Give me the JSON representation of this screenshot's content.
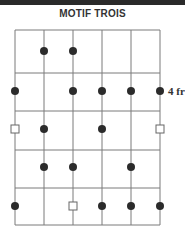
{
  "title": "MOTIF TROIS",
  "fret_label": "4 fr",
  "grid": {
    "strings_x": [
      15,
      44,
      73,
      102,
      131,
      160
    ],
    "frets_y": [
      30,
      73,
      111,
      150,
      188,
      225
    ],
    "line_color": "#7a7a7a",
    "dot_color": "#2b2b2b"
  },
  "rows": [
    {
      "fret": 1,
      "y": 51,
      "markers": [
        {
          "string": 2,
          "type": "dot"
        },
        {
          "string": 3,
          "type": "dot"
        }
      ]
    },
    {
      "fret": 2,
      "y": 91,
      "label": "4 fr",
      "markers": [
        {
          "string": 1,
          "type": "dot"
        },
        {
          "string": 3,
          "type": "dot"
        },
        {
          "string": 4,
          "type": "dot"
        },
        {
          "string": 5,
          "type": "dot"
        },
        {
          "string": 6,
          "type": "dot"
        }
      ]
    },
    {
      "fret": 3,
      "y": 129,
      "markers": [
        {
          "string": 1,
          "type": "square"
        },
        {
          "string": 2,
          "type": "dot"
        },
        {
          "string": 4,
          "type": "dot"
        },
        {
          "string": 6,
          "type": "square"
        }
      ]
    },
    {
      "fret": 4,
      "y": 167,
      "markers": [
        {
          "string": 2,
          "type": "dot"
        },
        {
          "string": 3,
          "type": "dot"
        },
        {
          "string": 5,
          "type": "dot"
        }
      ]
    },
    {
      "fret": 5,
      "y": 206,
      "markers": [
        {
          "string": 1,
          "type": "dot"
        },
        {
          "string": 3,
          "type": "square"
        },
        {
          "string": 4,
          "type": "dot"
        },
        {
          "string": 5,
          "type": "dot"
        },
        {
          "string": 6,
          "type": "dot"
        }
      ]
    }
  ]
}
